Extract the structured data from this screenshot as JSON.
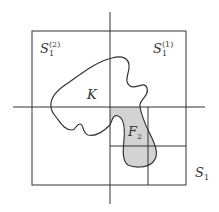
{
  "diagram": {
    "type": "set-partition-illustration",
    "colors": {
      "line": "#333333",
      "fill_shaded": "#d3d3d3",
      "background": "#ffffff"
    },
    "labels": {
      "S1_upper_left": {
        "base": "S",
        "sub": "1",
        "sup": "(2)"
      },
      "S1_upper_right": {
        "base": "S",
        "sub": "1",
        "sup": "(1)"
      },
      "K": {
        "base": "K"
      },
      "F2": {
        "base": "F",
        "sub": "2"
      },
      "S1": {
        "base": "S",
        "sub": "1"
      }
    },
    "elements": [
      "outer-square S1",
      "horizontal axis",
      "vertical axis",
      "inner subdivision lines (lower-right quadrant)",
      "closed curve K",
      "shaded region F2 = K ∩ lower-right quadrant"
    ]
  }
}
